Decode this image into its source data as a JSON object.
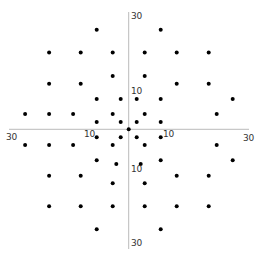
{
  "chart_data": {
    "type": "scatter",
    "title": "",
    "xlabel": "",
    "ylabel": "",
    "xlim": [
      -30,
      30
    ],
    "ylim": [
      -30,
      30
    ],
    "grid": false,
    "legend": null,
    "axes_through_origin": true,
    "tick_labels": {
      "x_left": [
        "30",
        "10"
      ],
      "x_right": [
        "10",
        "30"
      ],
      "y_top": [
        "30",
        "10"
      ],
      "y_bottom": [
        "10",
        "30"
      ]
    },
    "marker_color": "#000000",
    "axis_color": "#bbbbbb",
    "points": [
      [
        -8,
        24.9
      ],
      [
        8,
        24.9
      ],
      [
        -19.9,
        19.2
      ],
      [
        -12,
        19.2
      ],
      [
        -4,
        19.2
      ],
      [
        4,
        19.2
      ],
      [
        12,
        19.2
      ],
      [
        20,
        19.2
      ],
      [
        -4,
        13.3
      ],
      [
        4,
        13.3
      ],
      [
        -19.9,
        11.4
      ],
      [
        -12,
        11.4
      ],
      [
        12,
        11.4
      ],
      [
        20,
        11.4
      ],
      [
        -8,
        7.6
      ],
      [
        -2,
        7.6
      ],
      [
        2,
        7.6
      ],
      [
        8,
        7.6
      ],
      [
        26,
        7.6
      ],
      [
        -25.9,
        3.8
      ],
      [
        -19.9,
        3.8
      ],
      [
        -13.9,
        3.8
      ],
      [
        -4,
        3.8
      ],
      [
        4,
        3.8
      ],
      [
        22,
        3.8
      ],
      [
        -8,
        1.8
      ],
      [
        -2,
        1.8
      ],
      [
        2,
        1.8
      ],
      [
        8,
        1.8
      ],
      [
        0,
        0
      ],
      [
        -8,
        -2
      ],
      [
        -2,
        -2
      ],
      [
        2,
        -2
      ],
      [
        8,
        -2
      ],
      [
        -25.9,
        -3.9
      ],
      [
        -19.9,
        -3.9
      ],
      [
        -13.9,
        -3.9
      ],
      [
        -4,
        -3.9
      ],
      [
        4,
        -3.9
      ],
      [
        22,
        -3.9
      ],
      [
        -8,
        -7.75
      ],
      [
        8,
        -7.75
      ],
      [
        26,
        -7.75
      ],
      [
        -3.1,
        -8.7
      ],
      [
        3,
        -8.7
      ],
      [
        -19.9,
        -11.6
      ],
      [
        -12,
        -11.6
      ],
      [
        12,
        -11.6
      ],
      [
        20,
        -11.6
      ],
      [
        -4,
        -13.5
      ],
      [
        4,
        -13.5
      ],
      [
        -19.9,
        -19.25
      ],
      [
        -12,
        -19.25
      ],
      [
        -4,
        -19.25
      ],
      [
        4,
        -19.25
      ],
      [
        12,
        -19.25
      ],
      [
        20,
        -19.25
      ],
      [
        -8,
        -25
      ],
      [
        8,
        -25
      ]
    ]
  },
  "labels": {
    "x_left_30": "30",
    "x_left_10": "10",
    "x_right_10": "10",
    "x_right_30": "30",
    "y_top_30": "30",
    "y_top_10": "10",
    "y_bottom_10": "10",
    "y_bottom_30": "30"
  }
}
